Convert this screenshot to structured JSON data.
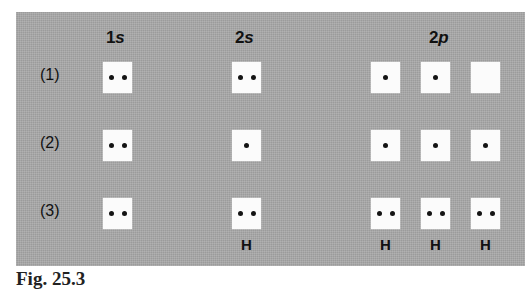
{
  "figure": {
    "caption": "Fig. 25.3",
    "panel_color": "#a9a9a9",
    "box_color": "#fbfbfb",
    "dot_color": "#141414",
    "text_color": "#111111"
  },
  "columns": [
    {
      "id": "1s",
      "prefix": "1",
      "orbital": "s",
      "x": 117,
      "boxes": 1
    },
    {
      "id": "2s",
      "prefix": "2",
      "orbital": "s",
      "x": 248,
      "boxes": 1
    },
    {
      "id": "2p",
      "prefix": "2",
      "orbital": "p",
      "x": 442,
      "boxes": 3
    }
  ],
  "rows": [
    {
      "label": "(1)"
    },
    {
      "label": "(2)"
    },
    {
      "label": "(3)"
    }
  ],
  "cells": [
    {
      "row": 0,
      "row_label": "(1)",
      "orbitals": [
        {
          "column": "1s",
          "x": 103,
          "y": 62,
          "electrons": 2,
          "sub": ""
        },
        {
          "column": "2s",
          "x": 232,
          "y": 62,
          "electrons": 2,
          "sub": ""
        },
        {
          "column": "2p",
          "x": 371,
          "y": 62,
          "electrons": 1,
          "sub": ""
        },
        {
          "column": "2p",
          "x": 421,
          "y": 62,
          "electrons": 1,
          "sub": ""
        },
        {
          "column": "2p",
          "x": 471,
          "y": 62,
          "electrons": 0,
          "sub": ""
        }
      ]
    },
    {
      "row": 1,
      "row_label": "(2)",
      "orbitals": [
        {
          "column": "1s",
          "x": 103,
          "y": 130,
          "electrons": 2,
          "sub": ""
        },
        {
          "column": "2s",
          "x": 232,
          "y": 130,
          "electrons": 1,
          "sub": ""
        },
        {
          "column": "2p",
          "x": 371,
          "y": 130,
          "electrons": 1,
          "sub": ""
        },
        {
          "column": "2p",
          "x": 421,
          "y": 130,
          "electrons": 1,
          "sub": ""
        },
        {
          "column": "2p",
          "x": 471,
          "y": 130,
          "electrons": 1,
          "sub": ""
        }
      ]
    },
    {
      "row": 2,
      "row_label": "(3)",
      "orbitals": [
        {
          "column": "1s",
          "x": 103,
          "y": 198,
          "electrons": 2,
          "sub": ""
        },
        {
          "column": "2s",
          "x": 232,
          "y": 198,
          "electrons": 2,
          "sub": "H"
        },
        {
          "column": "2p",
          "x": 371,
          "y": 198,
          "electrons": 2,
          "sub": "H"
        },
        {
          "column": "2p",
          "x": 421,
          "y": 198,
          "electrons": 2,
          "sub": "H"
        },
        {
          "column": "2p",
          "x": 471,
          "y": 198,
          "electrons": 2,
          "sub": "H"
        }
      ]
    }
  ],
  "row_label_positions": [
    {
      "label": "(1)",
      "x": 40,
      "y": 66
    },
    {
      "label": "(2)",
      "x": 40,
      "y": 134
    },
    {
      "label": "(3)",
      "x": 40,
      "y": 202
    }
  ],
  "column_header_positions": [
    {
      "id": "1s",
      "prefix": "1",
      "orbital": "s",
      "x": 106,
      "y": 28
    },
    {
      "id": "2s",
      "prefix": "2",
      "orbital": "s",
      "x": 235,
      "y": 28
    },
    {
      "id": "2p",
      "prefix": "2",
      "orbital": "p",
      "x": 429,
      "y": 28
    }
  ]
}
